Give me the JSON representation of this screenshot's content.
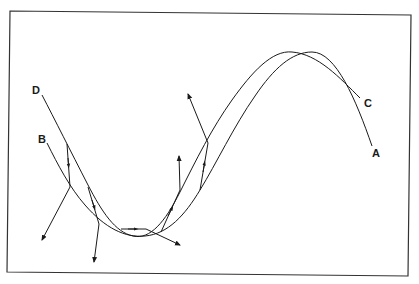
{
  "figure": {
    "type": "diagram",
    "colors": {
      "stroke": "#1a1a1a",
      "frame": "#333333",
      "background": "#ffffff"
    }
  },
  "curves": [
    {
      "id": "upper",
      "start_label": "D",
      "end_label": "C"
    },
    {
      "id": "lower",
      "start_label": "B",
      "end_label": "A"
    }
  ],
  "labels": {
    "D": "D",
    "B": "B",
    "C": "C",
    "A": "A"
  }
}
